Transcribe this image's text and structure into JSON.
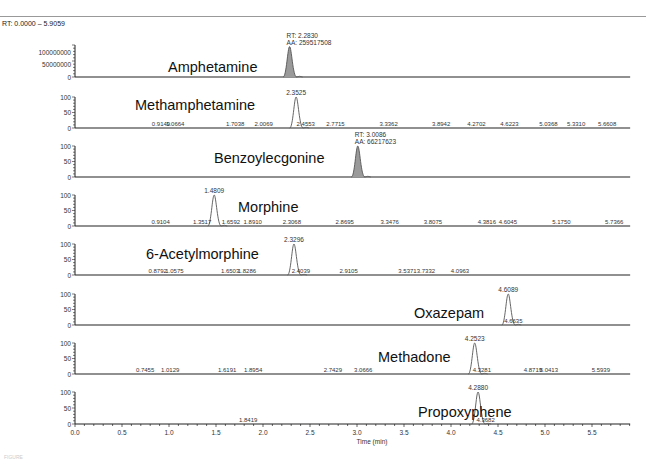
{
  "header": {
    "range_label": "RT: 0.0000 – 5.9059",
    "figure_caption": "FIGURE"
  },
  "chart_data": {
    "type": "line",
    "xlabel": "Time (min)",
    "xlim": [
      0.0,
      5.9059
    ],
    "x_ticks": [
      "0.0",
      "0.5",
      "1.0",
      "1.5",
      "2.0",
      "2.5",
      "3.0",
      "3.5",
      "4.0",
      "4.5",
      "5.0",
      "5.5"
    ],
    "grid": false,
    "legend": "none",
    "panels": [
      {
        "name": "Amphetamine",
        "y_ticks": [
          "100000000",
          "50000000",
          "0"
        ],
        "ylim": [
          0,
          130000000
        ],
        "peak_rt": 2.283,
        "peak_height_frac": 0.95,
        "filled": true,
        "annotation": [
          "RT: 2.2830",
          "AA: 259517508"
        ],
        "minor_labels": []
      },
      {
        "name": "Methamphetamine",
        "y_ticks": [
          "100",
          "50",
          "0"
        ],
        "ylim": [
          0,
          100
        ],
        "peak_rt": 2.3525,
        "peak_height_frac": 1.0,
        "filled": false,
        "annotation": [
          "2.3525"
        ],
        "minor_labels": [
          "0.9149",
          "1.0664",
          "1.7038",
          "2.0069",
          "2.4553",
          "2.7715",
          "3.3362",
          "3.8942",
          "4.2702",
          "4.6223",
          "5.0368",
          "5.3310",
          "5.6608"
        ]
      },
      {
        "name": "Benzoylecgonine",
        "y_ticks": [
          "100",
          "50",
          "0"
        ],
        "ylim": [
          0,
          100
        ],
        "peak_rt": 3.0086,
        "peak_height_frac": 1.0,
        "filled": true,
        "annotation": [
          "RT: 3.0086",
          "AA: 66217623"
        ],
        "minor_labels": []
      },
      {
        "name": "Morphine",
        "y_ticks": [
          "100",
          "50",
          "0"
        ],
        "ylim": [
          0,
          100
        ],
        "peak_rt": 1.4809,
        "peak_height_frac": 1.0,
        "filled": false,
        "annotation": [
          "1.4809"
        ],
        "minor_labels": [
          "0.9104",
          "1.3517",
          "1.6592",
          "1.8910",
          "2.3068",
          "2.8695",
          "3.3476",
          "3.8075",
          "4.3816",
          "4.6045",
          "5.1750",
          "5.7366"
        ]
      },
      {
        "name": "6-Acetylmorphine",
        "y_ticks": [
          "100",
          "50",
          "0"
        ],
        "ylim": [
          0,
          100
        ],
        "peak_rt": 2.3296,
        "peak_height_frac": 1.0,
        "filled": false,
        "annotation": [
          "2.3296"
        ],
        "minor_labels": [
          "0.8792",
          "1.0575",
          "1.6503",
          "1.8286",
          "2.4039",
          "2.9105",
          "3.5371",
          "3.7332",
          "4.0963"
        ]
      },
      {
        "name": "Oxazepam",
        "y_ticks": [
          "100",
          "50",
          "0"
        ],
        "ylim": [
          0,
          100
        ],
        "peak_rt": 4.6089,
        "peak_height_frac": 1.0,
        "filled": false,
        "annotation": [
          "4.6089"
        ],
        "minor_labels": [
          "4.6635"
        ]
      },
      {
        "name": "Methadone",
        "y_ticks": [
          "100",
          "50",
          "0"
        ],
        "ylim": [
          0,
          100
        ],
        "peak_rt": 4.2523,
        "peak_height_frac": 1.0,
        "filled": false,
        "annotation": [
          "4.2523"
        ],
        "minor_labels": [
          "0.7455",
          "1.0129",
          "1.6191",
          "1.8954",
          "2.7429",
          "3.0666",
          "4.3281",
          "4.8719",
          "5.0413",
          "5.5939"
        ]
      },
      {
        "name": "Propoxyphene",
        "y_ticks": [
          "100",
          "50",
          "0"
        ],
        "ylim": [
          0,
          100
        ],
        "peak_rt": 4.288,
        "peak_height_frac": 1.0,
        "filled": false,
        "annotation": [
          "4.2880"
        ],
        "minor_labels": [
          "1.8419",
          "4.3682"
        ]
      }
    ]
  }
}
